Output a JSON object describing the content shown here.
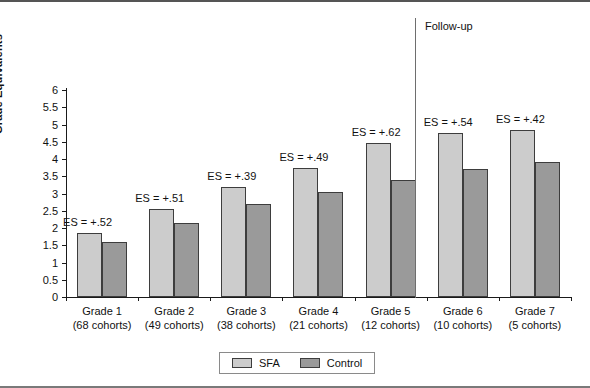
{
  "chart_data": {
    "type": "bar",
    "title": "",
    "xlabel": "",
    "ylabel": "Grade Equivalents",
    "ylim": [
      0,
      6
    ],
    "ytick_step": 0.5,
    "yticks": [
      "6",
      "5.5",
      "5",
      "4.5",
      "4",
      "3.5",
      "3",
      "2.5",
      "2",
      "1.5",
      "1",
      "0.5",
      "0"
    ],
    "grid": false,
    "legend_position": "bottom-center",
    "categories": [
      "Grade 1",
      "Grade 2",
      "Grade 3",
      "Grade 4",
      "Grade 5",
      "Grade 6",
      "Grade 7"
    ],
    "category_sublabels": [
      "(68 cohorts)",
      "(49 cohorts)",
      "(38 cohorts)",
      "(21 cohorts)",
      "(12 cohorts)",
      "(10 cohorts)",
      "(5 cohorts)"
    ],
    "series": [
      {
        "name": "SFA",
        "color": "#cccccc",
        "values": [
          1.85,
          2.55,
          3.2,
          3.75,
          4.45,
          4.75,
          4.85
        ]
      },
      {
        "name": "Control",
        "color": "#9a9a9a",
        "values": [
          1.6,
          2.15,
          2.7,
          3.05,
          3.4,
          3.7,
          3.9
        ]
      }
    ],
    "annotations": [
      "ES = +.52",
      "ES = +.51",
      "ES = +.39",
      "ES = +.49",
      "ES = +.62",
      "ES = +.54",
      "ES = +.42"
    ],
    "effect_sizes": [
      0.52,
      0.51,
      0.39,
      0.49,
      0.62,
      0.54,
      0.42
    ],
    "divider_label": "Follow-up",
    "divider_after_category": "Grade 5"
  },
  "legend": {
    "items": [
      {
        "label": "SFA",
        "color": "#cccccc"
      },
      {
        "label": "Control",
        "color": "#9a9a9a"
      }
    ]
  }
}
